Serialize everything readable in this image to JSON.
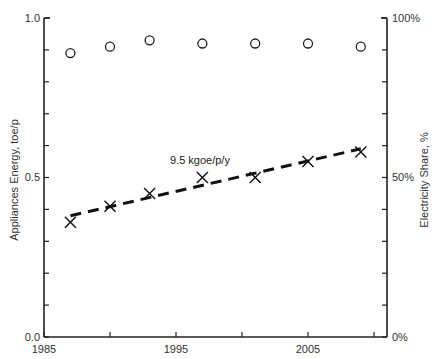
{
  "chart_data": {
    "type": "scatter",
    "title": "",
    "xlabel": "",
    "ylabel": "Appliances Energy, toe/p",
    "y2label": "Electricity Share, %",
    "xlim": [
      1985,
      2010
    ],
    "ylim": [
      0.0,
      1.0
    ],
    "y2lim": [
      0,
      100
    ],
    "grid": false,
    "legend": null,
    "x_ticks": [
      1985,
      1990,
      1995,
      2000,
      2005,
      2010
    ],
    "x_tick_labels": [
      "1985",
      "1995",
      "2005"
    ],
    "y_ticks": [
      0.0,
      0.1,
      0.2,
      0.3,
      0.4,
      0.5,
      0.6,
      0.7,
      0.8,
      0.9,
      1.0
    ],
    "y_tick_labels": [
      "0.0",
      "0.5",
      "1.0"
    ],
    "y2_ticks": [
      0,
      10,
      20,
      30,
      40,
      50,
      60,
      70,
      80,
      90,
      100
    ],
    "y2_tick_labels": [
      "0%",
      "50%",
      "100%"
    ],
    "series": [
      {
        "name": "Appliances Energy (toe/p)",
        "axis": "left",
        "marker": "x",
        "x": [
          1987,
          1990,
          1993,
          1997,
          2001,
          2005,
          2009
        ],
        "values": [
          0.36,
          0.41,
          0.45,
          0.5,
          0.5,
          0.55,
          0.58
        ]
      },
      {
        "name": "Electricity Share (%)",
        "axis": "right",
        "marker": "circle-open",
        "x": [
          1987,
          1990,
          1993,
          1997,
          2001,
          2005,
          2009
        ],
        "values": [
          89,
          91,
          93,
          92,
          92,
          92,
          91
        ]
      },
      {
        "name": "Trend",
        "axis": "left",
        "style": "dashed",
        "x": [
          1987,
          2009
        ],
        "values": [
          0.38,
          0.59
        ]
      }
    ],
    "annotations": [
      {
        "text": "9.5 kgoe/p/y",
        "x": 1994.5,
        "y": 0.55
      }
    ]
  },
  "labels": {
    "ylabel": "Appliances Energy, toe/p",
    "y2label": "Electricity Share, %",
    "trend_annotation": "9.5 kgoe/p/y",
    "x_1985": "1985",
    "x_1995": "1995",
    "x_2005": "2005",
    "y_0": "0.0",
    "y_05": "0.5",
    "y_1": "1.0",
    "y2_0": "0%",
    "y2_50": "50%",
    "y2_100": "100%"
  }
}
